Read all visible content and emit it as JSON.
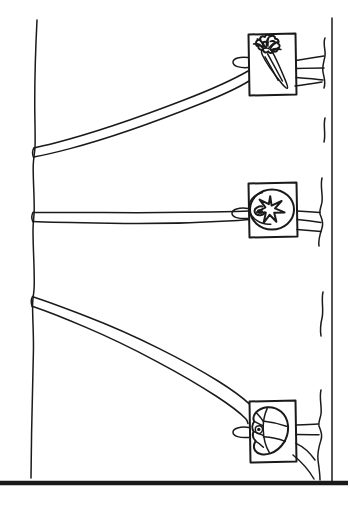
{
  "figure": {
    "background_color": "#ffffff",
    "ink_color": "#1a1a1a",
    "canvas": {
      "width": 350,
      "height": 512
    }
  },
  "border": {
    "bottom_rule": {
      "label": "bottom-rule",
      "y": 483,
      "x_start": 0,
      "x_end": 350,
      "weight": "thick"
    },
    "right_rule": {
      "label": "right-rule",
      "x": 332,
      "y_start": 18,
      "y_end": 483,
      "weight": "thin"
    }
  },
  "post": {
    "label": "vertical post",
    "x": 35,
    "y_top": 20,
    "y_bottom": 478,
    "weight": "thin"
  },
  "straps": [
    {
      "id": "strap-1",
      "label": "upper strap",
      "origin": {
        "x": 35,
        "y": 151
      },
      "terminus": {
        "x": 248,
        "y": 68
      },
      "direction": "up-right"
    },
    {
      "id": "strap-2",
      "label": "middle strap",
      "origin": {
        "x": 35,
        "y": 216
      },
      "terminus": {
        "x": 248,
        "y": 213
      },
      "direction": "level"
    },
    {
      "id": "strap-3",
      "label": "lower strap",
      "origin": {
        "x": 35,
        "y": 300
      },
      "terminus": {
        "x": 248,
        "y": 432
      },
      "direction": "down-right"
    }
  ],
  "tags": [
    {
      "id": "tag-1",
      "label": "carrot tag",
      "icon": "carrot-icon",
      "produce": "carrot",
      "rect": {
        "x": 248,
        "y": 33,
        "width": 48,
        "height": 62
      },
      "loop": {
        "cx": 243,
        "cy": 62,
        "rx": 9,
        "ry": 5
      },
      "tail_lines": 3
    },
    {
      "id": "tag-2",
      "label": "tomato tag",
      "icon": "tomato-icon",
      "produce": "tomato",
      "rect": {
        "x": 248,
        "y": 182,
        "width": 49,
        "height": 55
      },
      "loop": {
        "cx": 242,
        "cy": 213,
        "rx": 9,
        "ry": 5
      },
      "tail_lines": 2
    },
    {
      "id": "tag-3",
      "label": "garlic bulb tag",
      "icon": "garlic-icon",
      "produce": "garlic bulb",
      "rect": {
        "x": 249,
        "y": 400,
        "width": 47,
        "height": 62
      },
      "loop": {
        "cx": 243,
        "cy": 432,
        "rx": 9,
        "ry": 5
      },
      "tail_lines": 3
    }
  ],
  "right_wiggles": [
    {
      "id": "wiggle-1",
      "x": 324,
      "y_start": 38,
      "y_end": 120
    },
    {
      "id": "wiggle-2",
      "x": 324,
      "y_start": 140,
      "y_end": 178
    },
    {
      "id": "wiggle-3",
      "x": 322,
      "y_start": 178,
      "y_end": 270
    },
    {
      "id": "wiggle-4",
      "x": 322,
      "y_start": 292,
      "y_end": 336
    },
    {
      "id": "wiggle-5",
      "x": 322,
      "y_start": 390,
      "y_end": 480
    }
  ]
}
